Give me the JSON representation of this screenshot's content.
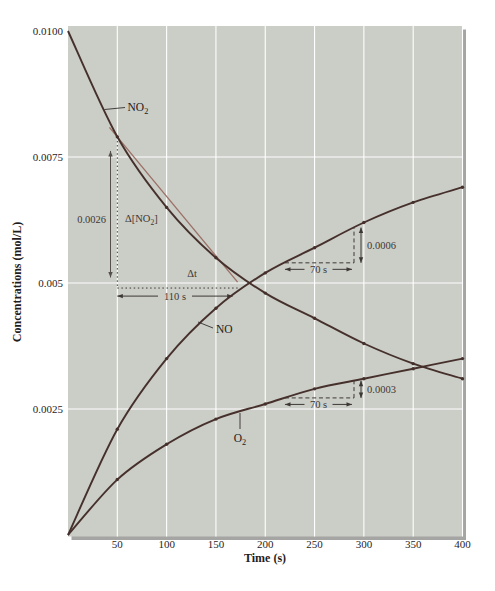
{
  "figure": {
    "background": "#ffffff",
    "plot_bg": "#cbcdc7",
    "grid_color": "#ffffff",
    "shadow_color": "#a5a5a3",
    "tick_text_color": "#1f1d1d",
    "annotation_color": "#3d3835",
    "tangent_color": "#9c7066",
    "curve_color": "#46302c"
  },
  "chart_data": {
    "type": "line",
    "title": "",
    "xlabel": "Time (s)",
    "ylabel": "Concentrations (mol/L)",
    "xlim": [
      0,
      400
    ],
    "ylim": [
      0,
      0.01
    ],
    "grid": true,
    "x_ticks": [
      50,
      100,
      150,
      200,
      250,
      300,
      350,
      400
    ],
    "y_ticks": [
      {
        "label": "0.0100",
        "value": 0.01
      },
      {
        "label": "0.0075",
        "value": 0.0075
      },
      {
        "label": "0.005",
        "value": 0.005
      },
      {
        "label": "0.0025",
        "value": 0.0025
      }
    ],
    "x": [
      0,
      50,
      100,
      150,
      200,
      250,
      300,
      350,
      400
    ],
    "series": [
      {
        "name": "NO2",
        "label_parts": [
          {
            "t": "NO"
          },
          {
            "t": "2",
            "sub": true
          }
        ],
        "values": [
          0.01,
          0.0079,
          0.0065,
          0.0055,
          0.0048,
          0.0043,
          0.0038,
          0.0034,
          0.0031
        ]
      },
      {
        "name": "NO",
        "label_parts": [
          {
            "t": "NO"
          }
        ],
        "values": [
          0.0,
          0.0021,
          0.0035,
          0.0045,
          0.0052,
          0.0057,
          0.0062,
          0.0066,
          0.0069
        ]
      },
      {
        "name": "O2",
        "label_parts": [
          {
            "t": "O"
          },
          {
            "t": "2",
            "sub": true
          }
        ],
        "values": [
          0.0,
          0.0011,
          0.0018,
          0.0023,
          0.0026,
          0.0029,
          0.0031,
          0.0033,
          0.0035
        ]
      }
    ]
  },
  "annotations": {
    "tangent_line": {
      "t1": 42,
      "c1": 0.008089,
      "t2": 172,
      "c2": 0.005016
    },
    "slope_triangle": {
      "v_arrow": {
        "t": 43.1,
        "c1": 0.00511,
        "c2": 0.00762
      },
      "v_arrow_label": "0.0026",
      "dotted_vertical": {
        "t": 50,
        "c1": 0.0079,
        "c2": 0.0049
      },
      "dotted_horizontal": {
        "c": 0.0049,
        "t1": 50,
        "t2": 172
      },
      "dconc_label_parts": [
        {
          "t": "Δ[NO"
        },
        {
          "t": "2",
          "sub": true
        },
        {
          "t": "]"
        }
      ],
      "dt_label": "Δt",
      "width_arrow": {
        "c": 0.00474,
        "t1": 50,
        "t2": 167,
        "label": "110 s"
      }
    },
    "rate_steps": [
      {
        "series": "NO",
        "t1": 220,
        "t2": 290,
        "dc_label": "0.0006",
        "dt_label": "70 s"
      },
      {
        "series": "O2",
        "t1": 220,
        "t2": 290,
        "dc_label": "0.0003",
        "dt_label": "70 s"
      }
    ],
    "curve_labels": [
      {
        "series": "NO2",
        "text_x": 127.5,
        "text_y": 111,
        "anchor": "start",
        "pointer": [
          104.5,
          109.5,
          125,
          107.5
        ]
      },
      {
        "series": "NO",
        "text_x": 216,
        "text_y": 333,
        "anchor": "start",
        "pointer": [
          198,
          322,
          213,
          328
        ]
      },
      {
        "series": "O2",
        "text_x": 240,
        "text_y": 442,
        "anchor": "middle",
        "pointer": [
          240,
          413,
          240,
          429
        ]
      }
    ]
  }
}
